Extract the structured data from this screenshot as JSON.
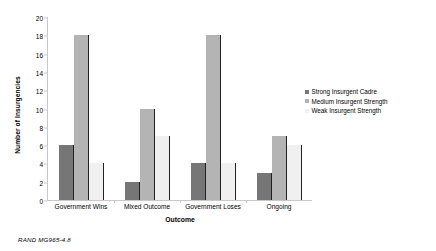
{
  "chart_data": {
    "type": "bar",
    "title": "",
    "xlabel": "Outcome",
    "ylabel": "Number of Insurgencies",
    "categories": [
      "Government Wins",
      "Mixed Outcome",
      "Government Loses",
      "Ongoing"
    ],
    "series": [
      {
        "name": "Strong Insurgent Cadre",
        "color": "#767676",
        "values": [
          6,
          2,
          4,
          3
        ]
      },
      {
        "name": "Medium Insurgent Strength",
        "color": "#b4b4b4",
        "values": [
          18,
          10,
          18,
          7
        ]
      },
      {
        "name": "Weak Insurgent Strength",
        "color": "#f0f0f0",
        "values": [
          4,
          7,
          4,
          6
        ]
      }
    ],
    "ylim": [
      0,
      20
    ],
    "yticks": [
      0,
      2,
      4,
      6,
      8,
      10,
      12,
      14,
      16,
      18,
      20
    ],
    "grid": false,
    "legend_position": "right"
  },
  "footer": {
    "note": "RAND MG965-4.8"
  }
}
